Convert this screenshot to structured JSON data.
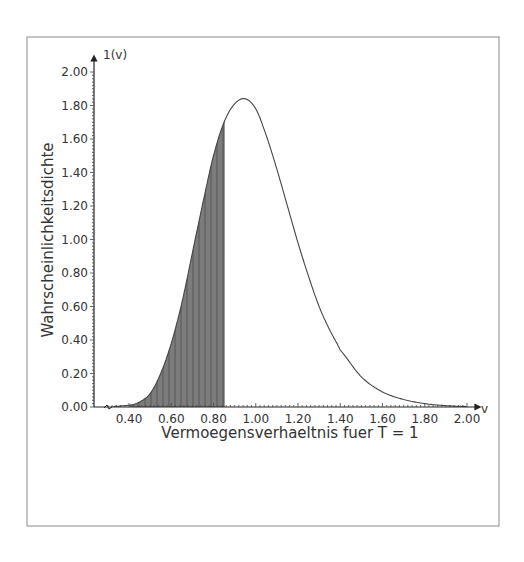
{
  "chart_data": {
    "type": "area",
    "title": "",
    "xlabel": "Vermoegensverhaeltnis fuer T = 1",
    "ylabel": "Wahrscheinlichkeitsdichte",
    "x_axis_symbol": "v",
    "y_axis_symbol": "1(v)",
    "xlim": [
      0.3,
      2.05
    ],
    "ylim": [
      0,
      2.05
    ],
    "x_ticks": [
      "0.40",
      "0.60",
      "0.80",
      "1.00",
      "1.20",
      "1.40",
      "1.60",
      "1.80",
      "2.00"
    ],
    "y_ticks": [
      "0.00",
      "0.20",
      "0.40",
      "0.60",
      "0.80",
      "1.00",
      "1.20",
      "1.40",
      "1.60",
      "1.80",
      "2.00"
    ],
    "grid": false,
    "legend": null,
    "series": [
      {
        "name": "density curve",
        "x": [
          0.4,
          0.45,
          0.5,
          0.55,
          0.6,
          0.65,
          0.7,
          0.75,
          0.8,
          0.85,
          0.9,
          0.95,
          1.0,
          1.05,
          1.1,
          1.15,
          1.2,
          1.25,
          1.3,
          1.35,
          1.4,
          1.5,
          1.6,
          1.7,
          1.8,
          1.9,
          2.0
        ],
        "values": [
          0.01,
          0.03,
          0.08,
          0.2,
          0.38,
          0.62,
          0.92,
          1.22,
          1.5,
          1.7,
          1.81,
          1.84,
          1.78,
          1.62,
          1.42,
          1.2,
          0.98,
          0.78,
          0.6,
          0.46,
          0.34,
          0.18,
          0.09,
          0.045,
          0.02,
          0.008,
          0.003
        ]
      }
    ],
    "shaded_region": {
      "x_from": 0.4,
      "x_to": 0.85,
      "fill": "#6e6e6e",
      "hatch": "vertical lines"
    },
    "annotations": [
      "axis break mark near x=0.30"
    ],
    "colors": {
      "curve": "#444444",
      "shade": "#7a7a7a",
      "frame": "#888888",
      "text": "#333333"
    }
  }
}
